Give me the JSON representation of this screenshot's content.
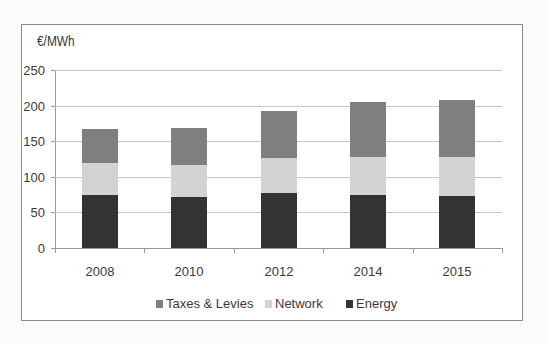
{
  "chart_data": {
    "type": "bar",
    "stacked": true,
    "title": "",
    "ylabel": "€/MWh",
    "xlabel": "",
    "categories": [
      "2008",
      "2010",
      "2012",
      "2014",
      "2015"
    ],
    "series": [
      {
        "name": "Energy",
        "color": "#333333",
        "values": [
          75,
          71,
          77,
          74,
          73
        ]
      },
      {
        "name": "Network",
        "color": "#d3d3d3",
        "values": [
          44,
          45,
          49,
          54,
          55
        ]
      },
      {
        "name": "Taxes & Levies",
        "color": "#7f7f7f",
        "values": [
          48,
          53,
          66,
          77,
          80
        ]
      }
    ],
    "totals": [
      167,
      169,
      192,
      205,
      208
    ],
    "ylim": [
      0,
      250
    ],
    "yticks": [
      0,
      50,
      100,
      150,
      200,
      250
    ],
    "grid": true,
    "legend": {
      "position": "bottom",
      "entries": [
        "Taxes & Levies",
        "Network",
        "Energy"
      ]
    }
  },
  "chart": {
    "unit_label": "€/MWh",
    "y_tick_labels": [
      "250",
      "200",
      "150",
      "100",
      "50",
      "0"
    ],
    "x_labels": [
      "2008",
      "2010",
      "2012",
      "2014",
      "2015"
    ],
    "legend": [
      {
        "label": "Taxes & Levies",
        "color": "#7f7f7f"
      },
      {
        "label": "Network",
        "color": "#d3d3d3"
      },
      {
        "label": "Energy",
        "color": "#333333"
      }
    ]
  }
}
